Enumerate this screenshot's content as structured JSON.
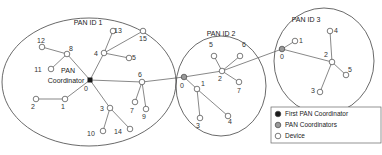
{
  "diagram": {
    "colors": {
      "first_coordinator": "#1a1a1a",
      "pan_coordinator": "#999999",
      "device": "#ffffff",
      "stroke": "#555555"
    },
    "pans": [
      {
        "title": "PAN ID 1",
        "ellipse": {
          "cx": 89,
          "cy": 82,
          "rx": 87,
          "ry": 64
        },
        "title_pos": {
          "x": 88,
          "y": 25
        },
        "coordinator_label": [
          "PAN",
          "Coordinator"
        ],
        "nodes": [
          {
            "id": "0",
            "x": 90,
            "y": 80,
            "type": "first",
            "lx": 86,
            "ly": 91
          },
          {
            "id": "8",
            "x": 67,
            "y": 54,
            "type": "device",
            "lx": 71,
            "ly": 51
          },
          {
            "id": "12",
            "x": 42,
            "y": 47,
            "type": "device",
            "lx": 41,
            "ly": 43
          },
          {
            "id": "11",
            "x": 51,
            "y": 69,
            "type": "device",
            "lx": 38,
            "ly": 72
          },
          {
            "id": "4",
            "x": 104,
            "y": 53,
            "type": "device",
            "lx": 96,
            "ly": 56
          },
          {
            "id": "13",
            "x": 113,
            "y": 31,
            "type": "device",
            "lx": 118,
            "ly": 33
          },
          {
            "id": "15",
            "x": 143,
            "y": 31,
            "type": "device",
            "lx": 143,
            "ly": 41
          },
          {
            "id": "5",
            "x": 129,
            "y": 58,
            "type": "device",
            "lx": 134,
            "ly": 60
          },
          {
            "id": "1",
            "x": 65,
            "y": 99,
            "type": "device",
            "lx": 63,
            "ly": 109
          },
          {
            "id": "2",
            "x": 36,
            "y": 99,
            "type": "device",
            "lx": 33,
            "ly": 109
          },
          {
            "id": "3",
            "x": 110,
            "y": 108,
            "type": "device",
            "lx": 102,
            "ly": 111
          },
          {
            "id": "10",
            "x": 103,
            "y": 131,
            "type": "device",
            "lx": 91,
            "ly": 136
          },
          {
            "id": "14",
            "x": 130,
            "y": 129,
            "type": "device",
            "lx": 118,
            "ly": 134
          },
          {
            "id": "6",
            "x": 142,
            "y": 82,
            "type": "device",
            "lx": 140,
            "ly": 77
          },
          {
            "id": "7",
            "x": 135,
            "y": 102,
            "type": "device",
            "lx": 132,
            "ly": 113
          },
          {
            "id": "9",
            "x": 146,
            "y": 109,
            "type": "device",
            "lx": 144,
            "ly": 119
          }
        ],
        "edges": [
          [
            "0",
            "8"
          ],
          [
            "8",
            "12"
          ],
          [
            "8",
            "11"
          ],
          [
            "0",
            "4"
          ],
          [
            "4",
            "13"
          ],
          [
            "4",
            "15"
          ],
          [
            "4",
            "5"
          ],
          [
            "0",
            "1"
          ],
          [
            "1",
            "2"
          ],
          [
            "0",
            "3"
          ],
          [
            "3",
            "10"
          ],
          [
            "3",
            "14"
          ],
          [
            "0",
            "6"
          ],
          [
            "6",
            "7"
          ],
          [
            "6",
            "9"
          ]
        ]
      },
      {
        "title": "PAN ID 2",
        "ellipse": {
          "cx": 221,
          "cy": 86,
          "rx": 45,
          "ry": 50
        },
        "title_pos": {
          "x": 221,
          "y": 36
        },
        "nodes": [
          {
            "id": "0",
            "x": 184,
            "y": 77,
            "type": "coordinator",
            "lx": 182,
            "ly": 88
          },
          {
            "id": "1",
            "x": 197,
            "y": 89,
            "type": "device",
            "lx": 203,
            "ly": 86
          },
          {
            "id": "3",
            "x": 200,
            "y": 118,
            "type": "device",
            "lx": 198,
            "ly": 128
          },
          {
            "id": "4",
            "x": 228,
            "y": 116,
            "type": "device",
            "lx": 230,
            "ly": 124
          },
          {
            "id": "2",
            "x": 222,
            "y": 71,
            "type": "device",
            "lx": 220,
            "ly": 81
          },
          {
            "id": "5",
            "x": 214,
            "y": 56,
            "type": "device",
            "lx": 211,
            "ly": 47
          },
          {
            "id": "6",
            "x": 240,
            "y": 56,
            "type": "device",
            "lx": 244,
            "ly": 47
          },
          {
            "id": "7",
            "x": 239,
            "y": 82,
            "type": "device",
            "lx": 239,
            "ly": 93
          }
        ],
        "edges": [
          [
            "0",
            "1"
          ],
          [
            "1",
            "3"
          ],
          [
            "1",
            "4"
          ],
          [
            "0",
            "2"
          ],
          [
            "2",
            "5"
          ],
          [
            "2",
            "6"
          ],
          [
            "2",
            "7"
          ]
        ]
      },
      {
        "title": "PAN ID 3",
        "ellipse": {
          "cx": 324,
          "cy": 61,
          "rx": 50,
          "ry": 53
        },
        "title_pos": {
          "x": 306,
          "y": 22
        },
        "nodes": [
          {
            "id": "0",
            "x": 282,
            "y": 49,
            "type": "coordinator",
            "lx": 282,
            "ly": 59
          },
          {
            "id": "1",
            "x": 295,
            "y": 41,
            "type": "device",
            "lx": 301,
            "ly": 43
          },
          {
            "id": "2",
            "x": 332,
            "y": 62,
            "type": "device",
            "lx": 326,
            "ly": 57
          },
          {
            "id": "4",
            "x": 330,
            "y": 31,
            "type": "device",
            "lx": 336,
            "ly": 33
          },
          {
            "id": "5",
            "x": 346,
            "y": 75,
            "type": "device",
            "lx": 350,
            "ly": 72
          },
          {
            "id": "3",
            "x": 320,
            "y": 92,
            "type": "device",
            "lx": 313,
            "ly": 93
          }
        ],
        "edges": [
          [
            "0",
            "1"
          ],
          [
            "0",
            "2"
          ],
          [
            "2",
            "4"
          ],
          [
            "2",
            "5"
          ],
          [
            "2",
            "3"
          ]
        ]
      }
    ],
    "inter_edges": [
      {
        "from": {
          "x": 142,
          "y": 82
        },
        "to": {
          "x": 184,
          "y": 77
        }
      },
      {
        "from": {
          "x": 222,
          "y": 71
        },
        "to": {
          "x": 282,
          "y": 49
        }
      }
    ],
    "legend": {
      "box": {
        "x": 271,
        "y": 107,
        "w": 110,
        "h": 36
      },
      "items": [
        {
          "label": "First PAN Coordinator",
          "type": "first"
        },
        {
          "label": "PAN Coordinators",
          "type": "coordinator"
        },
        {
          "label": "Device",
          "type": "device"
        }
      ]
    }
  }
}
